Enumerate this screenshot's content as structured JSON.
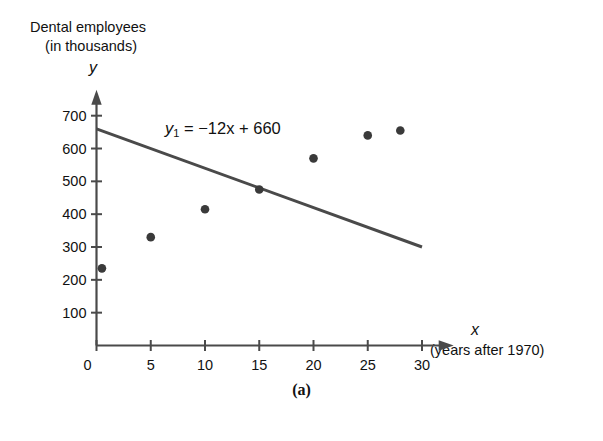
{
  "figure": {
    "caption": "(a)"
  },
  "chart_data": {
    "type": "scatter",
    "title": "",
    "subtitle": "",
    "ylabel_line1": "Dental employees",
    "ylabel_line2": "(in thousands)",
    "y_axis_variable": "y",
    "x_axis_variable": "x",
    "xlabel": "(years after 1970)",
    "xlim": [
      0,
      32
    ],
    "ylim": [
      0,
      730
    ],
    "grid": false,
    "legend": "none",
    "x_ticks": [
      0,
      5,
      10,
      15,
      20,
      25,
      30
    ],
    "x_tick_labels": [
      "0",
      "5",
      "10",
      "15",
      "20",
      "25",
      "30"
    ],
    "y_ticks": [
      100,
      200,
      300,
      400,
      500,
      600,
      700
    ],
    "y_tick_labels": [
      "100",
      "200",
      "300",
      "400",
      "500",
      "600",
      "700"
    ],
    "point_color": "#3a3a3a",
    "line_color": "#4a4a4a",
    "axis_color": "#4a4a4a",
    "series": [
      {
        "name": "Dental employees",
        "type": "scatter",
        "x": [
          0.5,
          5,
          10,
          15,
          20,
          25,
          28
        ],
        "y": [
          235,
          330,
          415,
          475,
          570,
          640,
          655
        ],
        "points": [
          {
            "x": 0.5,
            "y": 235
          },
          {
            "x": 5,
            "y": 330
          },
          {
            "x": 10,
            "y": 415
          },
          {
            "x": 15,
            "y": 475
          },
          {
            "x": 20,
            "y": 570
          },
          {
            "x": 25,
            "y": 640
          },
          {
            "x": 28,
            "y": 655
          }
        ]
      },
      {
        "name": "y1 = -12x + 660",
        "type": "line",
        "equation_display": "= −12x + 660",
        "equation_symbol": "y",
        "equation_subscript": "1",
        "slope": -12,
        "intercept": 660,
        "x": [
          0,
          30
        ],
        "y": [
          660,
          300
        ]
      }
    ],
    "annotations": [
      {
        "text": "y₁ = −12x + 660",
        "x": 11,
        "y": 620
      }
    ]
  }
}
